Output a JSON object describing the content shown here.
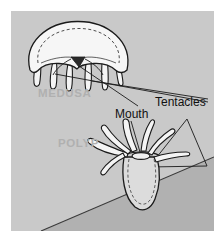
{
  "figure": {
    "kind": "biology-diagram",
    "background_color": "#c9c9c9",
    "page_color": "#ffffff",
    "seafloor_color": "#b0b0b0",
    "body_fill_color": "#f2f2f2",
    "polyp_body_fill_color": "#d8d8d8",
    "ink_color": "#1a1a1a",
    "ghost_label_color": "#b0b0b0",
    "dark_label_color": "#111111"
  },
  "labels": {
    "medusa": "MEDUSA",
    "polyp": "POLYP",
    "tentacles": "Tentacles",
    "mouth": "Mouth"
  }
}
